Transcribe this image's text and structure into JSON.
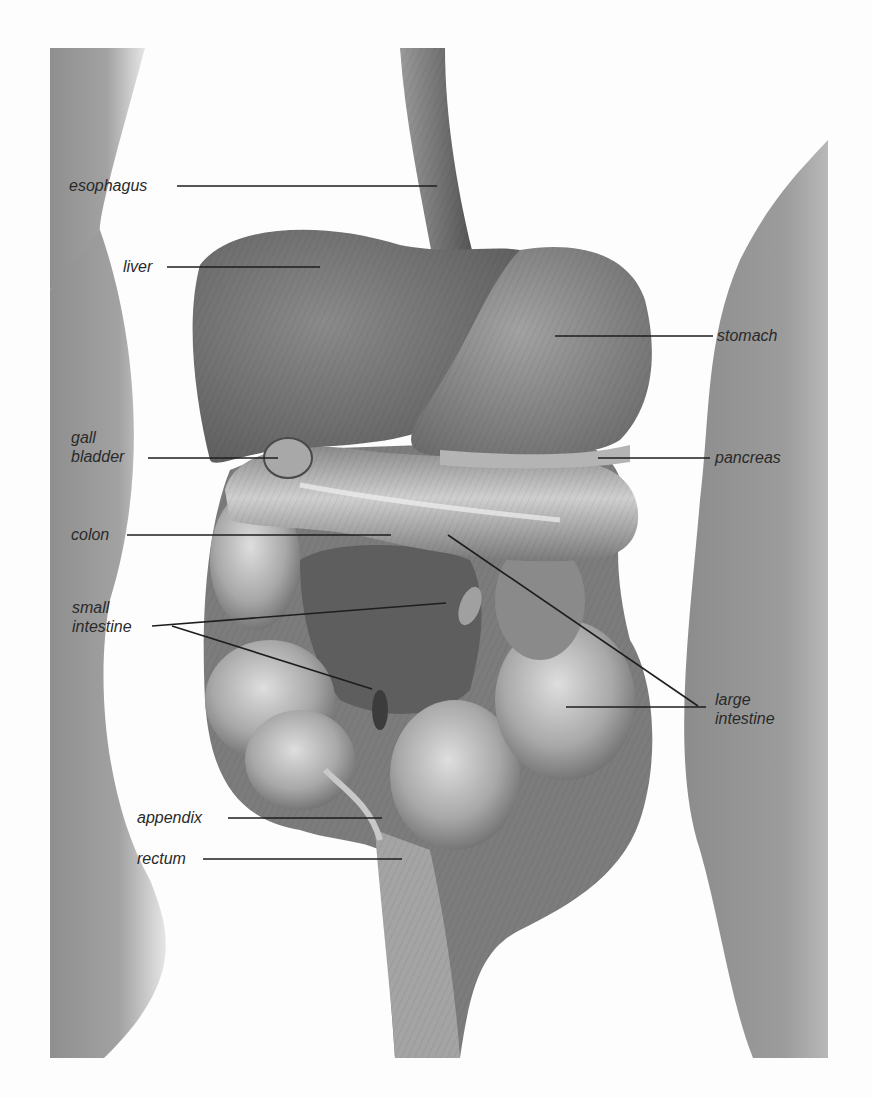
{
  "diagram": {
    "type": "anatomical illustration",
    "colors": {
      "background": "#fdfdfd",
      "body_silhouette": "#9a9a9a",
      "organ_dark": "#6e6e6e",
      "organ_mid": "#8a8a8a",
      "organ_light": "#bdbdbd",
      "leader_line": "#1e1e1e",
      "label_text": "#2a2a2a"
    },
    "labels": {
      "esophagus": {
        "line1": "esophagus",
        "line2": ""
      },
      "liver": {
        "line1": "liver",
        "line2": ""
      },
      "stomach": {
        "line1": "stomach",
        "line2": ""
      },
      "gall_bladder": {
        "line1": "gall",
        "line2": "bladder"
      },
      "pancreas": {
        "line1": "pancreas",
        "line2": ""
      },
      "colon": {
        "line1": "colon",
        "line2": ""
      },
      "small_intestine": {
        "line1": "small",
        "line2": "intestine"
      },
      "large_intestine": {
        "line1": "large",
        "line2": "intestine"
      },
      "appendix": {
        "line1": "appendix",
        "line2": ""
      },
      "rectum": {
        "line1": "rectum",
        "line2": ""
      }
    }
  }
}
